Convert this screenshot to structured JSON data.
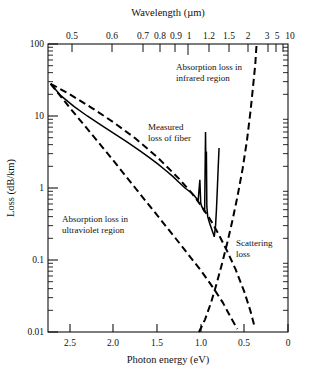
{
  "chart_data": {
    "type": "line",
    "title": "",
    "xlabel": "Photon energy (eV)",
    "ylabel": "Loss (dB/km)",
    "x2label": "Wavelength (µm)",
    "xscale": "linear-reversed",
    "yscale": "log",
    "xlim": [
      2.75,
      0.0
    ],
    "ylim": [
      0.01,
      100
    ],
    "grid": false,
    "legend_position": "inline-annotations",
    "xticks": [
      "2.5",
      "2.0",
      "1.5",
      "1.0",
      "0.5",
      "0"
    ],
    "xtick_values": [
      2.5,
      2.0,
      1.5,
      1.0,
      0.5,
      0
    ],
    "yticks": [
      "100",
      "10",
      "1",
      "0.1",
      "0.01"
    ],
    "ytick_values": [
      100,
      10,
      1,
      0.1,
      0.01
    ],
    "x2ticks": [
      "0.5",
      "0.6",
      "0.7",
      "0.8",
      "0.9",
      "1",
      "1.2",
      "1.5",
      "2",
      "3",
      "5",
      "10"
    ],
    "x2tick_values_um": [
      0.5,
      0.6,
      0.7,
      0.8,
      0.9,
      1.0,
      1.2,
      1.5,
      2.0,
      3.0,
      5.0,
      10.0
    ],
    "annotations": [
      {
        "name": "infrared-absorption-label",
        "text_line1": "Absorption loss in",
        "text_line2": "infrared region"
      },
      {
        "name": "measured-loss-label",
        "text_line1": "Measured",
        "text_line2": "loss of fiber"
      },
      {
        "name": "ultraviolet-absorption-label",
        "text_line1": "Absorption loss in",
        "text_line2": "ultraviolet region"
      },
      {
        "name": "scattering-loss-label",
        "text_line1": "Scattering",
        "text_line2": "loss"
      }
    ],
    "series": [
      {
        "name": "Measured loss of fiber",
        "style": "solid",
        "points_ev_db": [
          [
            2.72,
            28
          ],
          [
            2.6,
            19
          ],
          [
            2.45,
            13.5
          ],
          [
            2.3,
            10.0
          ],
          [
            2.15,
            7.6
          ],
          [
            2.0,
            5.8
          ],
          [
            1.85,
            4.4
          ],
          [
            1.7,
            3.3
          ],
          [
            1.6,
            2.7
          ],
          [
            1.5,
            2.2
          ],
          [
            1.4,
            1.75
          ],
          [
            1.32,
            1.45
          ],
          [
            1.25,
            1.2
          ],
          [
            1.18,
            1.0
          ],
          [
            1.12,
            0.88
          ],
          [
            1.08,
            0.8
          ],
          [
            1.05,
            0.72
          ],
          [
            1.03,
            0.66
          ],
          [
            1.01,
            1.3
          ],
          [
            1.0,
            0.62
          ],
          [
            0.99,
            0.56
          ],
          [
            0.97,
            0.5
          ],
          [
            0.955,
            0.46
          ],
          [
            0.945,
            6.0
          ],
          [
            0.94,
            1.6
          ],
          [
            0.935,
            3.2
          ],
          [
            0.93,
            0.55
          ],
          [
            0.92,
            0.4
          ],
          [
            0.9,
            0.33
          ],
          [
            0.88,
            0.28
          ],
          [
            0.86,
            0.24
          ],
          [
            0.845,
            0.21
          ],
          [
            0.83,
            0.3
          ],
          [
            0.82,
            0.5
          ],
          [
            0.81,
            0.95
          ],
          [
            0.8,
            1.9
          ],
          [
            0.79,
            3.6
          ]
        ]
      },
      {
        "name": "Absorption loss in ultraviolet region",
        "style": "dashed",
        "points_ev_db": [
          [
            2.72,
            28
          ],
          [
            2.5,
            13.0
          ],
          [
            2.25,
            5.6
          ],
          [
            2.0,
            2.4
          ],
          [
            1.75,
            1.0
          ],
          [
            1.5,
            0.42
          ],
          [
            1.25,
            0.175
          ],
          [
            1.0,
            0.072
          ],
          [
            0.85,
            0.04
          ],
          [
            0.75,
            0.026
          ],
          [
            0.65,
            0.0155
          ],
          [
            0.58,
            0.011
          ]
        ]
      },
      {
        "name": "Scattering loss",
        "style": "dashed",
        "points_ev_db": [
          [
            2.72,
            28
          ],
          [
            2.5,
            20.0
          ],
          [
            2.25,
            13.0
          ],
          [
            2.0,
            8.2
          ],
          [
            1.75,
            4.9
          ],
          [
            1.5,
            2.7
          ],
          [
            1.25,
            1.35
          ],
          [
            1.1,
            0.84
          ],
          [
            1.0,
            0.58
          ],
          [
            0.9,
            0.38
          ],
          [
            0.8,
            0.235
          ],
          [
            0.7,
            0.135
          ],
          [
            0.6,
            0.074
          ],
          [
            0.5,
            0.036
          ],
          [
            0.43,
            0.0195
          ],
          [
            0.38,
            0.0115
          ]
        ]
      },
      {
        "name": "Absorption loss in infrared region",
        "style": "dashed",
        "points_ev_db": [
          [
            1.02,
            0.01
          ],
          [
            0.95,
            0.015
          ],
          [
            0.88,
            0.026
          ],
          [
            0.82,
            0.046
          ],
          [
            0.76,
            0.085
          ],
          [
            0.7,
            0.165
          ],
          [
            0.64,
            0.34
          ],
          [
            0.58,
            0.75
          ],
          [
            0.52,
            1.85
          ],
          [
            0.47,
            4.6
          ],
          [
            0.43,
            11.5
          ],
          [
            0.4,
            26.0
          ],
          [
            0.375,
            52.0
          ],
          [
            0.36,
            100
          ]
        ]
      }
    ]
  }
}
